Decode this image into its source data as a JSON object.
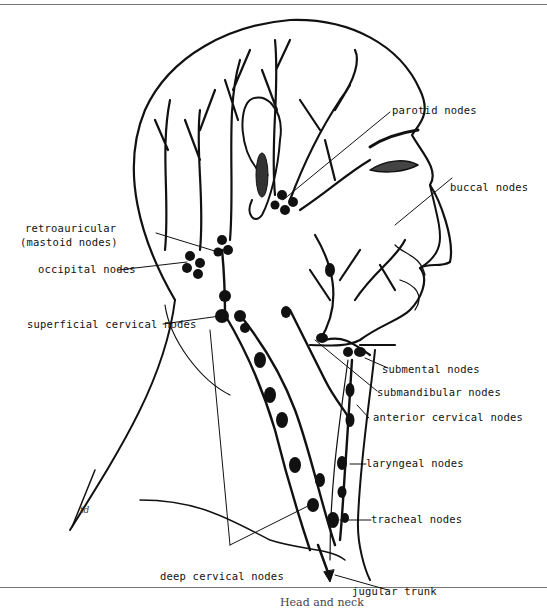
{
  "figure": {
    "signature": "td",
    "caption_partial": "Head and neck",
    "labels": {
      "parotid": "parotid nodes",
      "buccal": "buccal nodes",
      "retroauricular_1": "retroauricular",
      "retroauricular_2": "(mastoid nodes)",
      "occipital": "occipital nodes",
      "superficial_cervical": "superficial cervical nodes",
      "submental": "submental nodes",
      "submandibular": "submandibular nodes",
      "anterior_cervical": "anterior cervical nodes",
      "laryngeal": "laryngeal nodes",
      "tracheal": "tracheal nodes",
      "deep_cervical": "deep cervical nodes",
      "jugular_trunk": "jugular trunk"
    }
  }
}
